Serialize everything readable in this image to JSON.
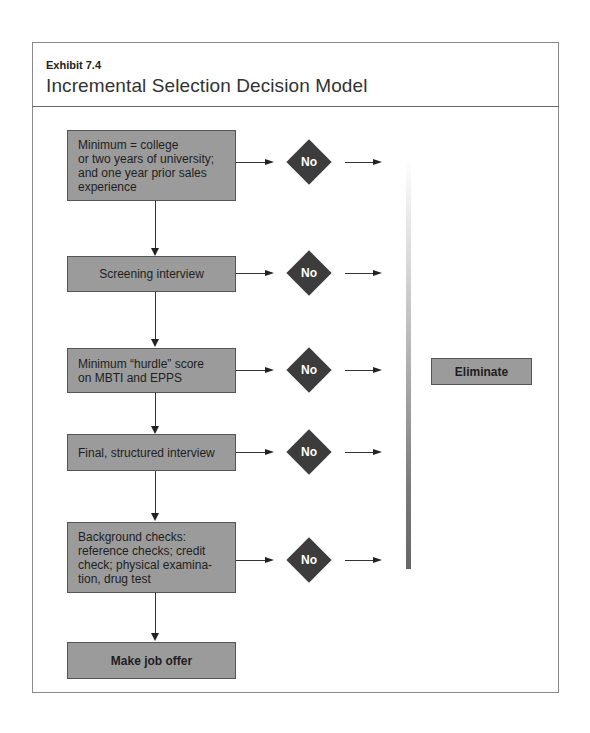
{
  "header": {
    "exhibit_label": "Exhibit 7.4",
    "title": "Incremental Selection Decision Model"
  },
  "steps": [
    {
      "label": "Minimum = college\nor two years of university;\nand one year prior sales\nexperience",
      "decision": "No"
    },
    {
      "label": "Screening interview",
      "decision": "No"
    },
    {
      "label": "Minimum  “hurdle” score\non MBTI and EPPS",
      "decision": "No"
    },
    {
      "label": "Final, structured interview",
      "decision": "No"
    },
    {
      "label": "Background checks:\nreference checks; credit\ncheck; physical examina-\ntion, drug test",
      "decision": "No"
    },
    {
      "label": "Make job offer"
    }
  ],
  "outcome": {
    "eliminate_label": "Eliminate"
  },
  "colors": {
    "box_fill": "#9b9b9b",
    "diamond_fill": "#3c3c3c",
    "gradient_bottom": "#666666"
  }
}
